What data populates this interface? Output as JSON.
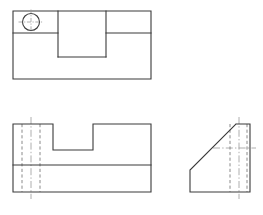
{
  "sheet": {
    "title": "Orthographic Projection - Notched Block with Chamfer",
    "width": 263,
    "height": 215,
    "background_color": "#ffffff",
    "visible_line_color": "#3a3a3a",
    "hidden_line_color": "#7e7e7e",
    "center_line_color": "#9a9a9a",
    "visible_line_width": 1.1,
    "hidden_line_width": 0.9,
    "center_line_width": 0.8,
    "projection": "third-angle",
    "view_count": 3
  },
  "chart_data": {
    "type": "line",
    "xlabel": "",
    "ylabel": "",
    "grid": false,
    "legend": "none",
    "xlim": [
      0,
      263
    ],
    "ylim": [
      0,
      215
    ],
    "views": [
      {
        "name": "top-view",
        "label": "Top View",
        "bounds": {
          "x": 13,
          "y": 11,
          "width": 138,
          "height": 68
        },
        "outline": [
          [
            13,
            11
          ],
          [
            151,
            11
          ],
          [
            151,
            79
          ],
          [
            13,
            79
          ],
          [
            13,
            11
          ]
        ],
        "internal_edges": [
          {
            "name": "left-slot-edge-top",
            "from": [
              13,
              33
            ],
            "to": [
              58,
              33
            ]
          },
          {
            "name": "right-slot-edge-top",
            "from": [
              106,
              33
            ],
            "to": [
              151,
              33
            ]
          },
          {
            "name": "slot-left-wall",
            "from": [
              58,
              11
            ],
            "to": [
              58,
              57
            ]
          },
          {
            "name": "slot-right-wall",
            "from": [
              106,
              11
            ],
            "to": [
              106,
              57
            ]
          },
          {
            "name": "slot-bottom",
            "from": [
              58,
              57
            ],
            "to": [
              106,
              57
            ]
          }
        ],
        "hole": {
          "name": "through-hole",
          "center_x": 31,
          "center_y": 22,
          "radius": 8.5,
          "centerline_extension": 4
        }
      },
      {
        "name": "front-view",
        "label": "Front View",
        "bounds": {
          "x": 13,
          "y": 124,
          "width": 138,
          "height": 68
        },
        "outline": [
          [
            13,
            124
          ],
          [
            53,
            124
          ],
          [
            53,
            150
          ],
          [
            93,
            150
          ],
          [
            93,
            124
          ],
          [
            151,
            124
          ],
          [
            151,
            192
          ],
          [
            13,
            192
          ],
          [
            13,
            124
          ]
        ],
        "internal_edges": [
          {
            "name": "base-split-line",
            "from": [
              13,
              165
            ],
            "to": [
              151,
              165
            ]
          }
        ],
        "hidden_lines": [
          {
            "name": "hole-wall-left",
            "from": [
              22,
              124
            ],
            "to": [
              22,
              192
            ]
          },
          {
            "name": "hole-wall-right",
            "from": [
              40,
              124
            ],
            "to": [
              40,
              192
            ]
          }
        ],
        "center_lines": [
          {
            "name": "hole-centerline-vertical",
            "from": [
              31,
              117
            ],
            "to": [
              31,
              199
            ]
          }
        ]
      },
      {
        "name": "side-view",
        "label": "Right Side View",
        "bounds": {
          "x": 190,
          "y": 124,
          "width": 60,
          "height": 68
        },
        "outline": [
          [
            236,
            124
          ],
          [
            250,
            124
          ],
          [
            250,
            192
          ],
          [
            190,
            192
          ],
          [
            190,
            170
          ],
          [
            236,
            124
          ]
        ],
        "hidden_lines": [
          {
            "name": "hole-wall-left",
            "from": [
              230,
              124
            ],
            "to": [
              230,
              192
            ]
          },
          {
            "name": "hole-wall-right",
            "from": [
              247,
              124
            ],
            "to": [
              247,
              192
            ]
          }
        ],
        "center_lines": [
          {
            "name": "hole-centerline-vertical",
            "from": [
              239,
              117
            ],
            "to": [
              239,
              199
            ]
          },
          {
            "name": "hole-centerline-horizontal",
            "from": [
              213,
              148
            ],
            "to": [
              256,
              148
            ]
          }
        ]
      }
    ]
  }
}
